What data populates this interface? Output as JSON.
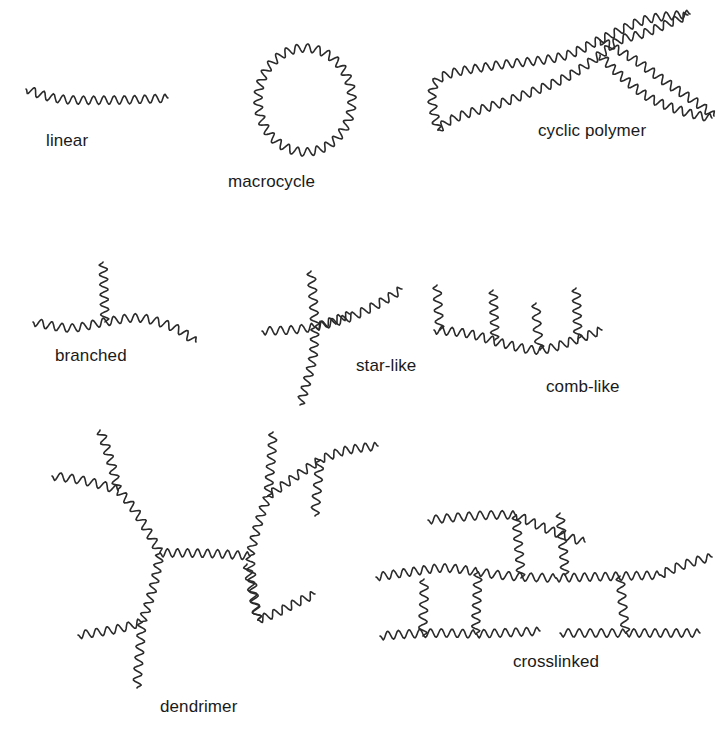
{
  "figure": {
    "width": 723,
    "height": 739,
    "background_color": "#ffffff",
    "stroke_color": "#2b2b2b",
    "stroke_width": 1.6,
    "label_color": "#1a1a1a",
    "label_font_size": 17,
    "wave": {
      "period": 10.5,
      "amplitude": 4.2
    }
  },
  "labels": [
    {
      "id": "linear",
      "text": "linear",
      "x": 46,
      "y": 131
    },
    {
      "id": "macrocycle",
      "text": "macrocycle",
      "x": 228,
      "y": 172
    },
    {
      "id": "cyclic",
      "text": "cyclic polymer",
      "x": 538,
      "y": 121
    },
    {
      "id": "branched",
      "text": "branched",
      "x": 55,
      "y": 346
    },
    {
      "id": "star",
      "text": "star-like",
      "x": 356,
      "y": 356
    },
    {
      "id": "comb",
      "text": "comb-like",
      "x": 546,
      "y": 377
    },
    {
      "id": "dendrimer",
      "text": "dendrimer",
      "x": 160,
      "y": 697
    },
    {
      "id": "crosslinked",
      "text": "crosslinked",
      "x": 513,
      "y": 652
    }
  ],
  "structures": [
    {
      "id": "linear",
      "name": "linear",
      "chains": [
        {
          "points": [
            [
              26,
              89
            ],
            [
              60,
              99
            ],
            [
              120,
              100
            ],
            [
              168,
              98
            ]
          ]
        }
      ]
    },
    {
      "id": "macrocycle",
      "name": "macrocycle",
      "rings": [
        {
          "cx": 305,
          "cy": 100,
          "rx": 47,
          "ry": 52
        }
      ],
      "chains": []
    },
    {
      "id": "cyclic-polymer",
      "name": "cyclic polymer",
      "chains": [
        {
          "points": [
            [
              438,
              130
            ],
            [
              432,
              95
            ],
            [
              444,
              76
            ],
            [
              492,
              66
            ],
            [
              560,
              57
            ],
            [
              600,
              40
            ],
            [
              645,
              20
            ],
            [
              690,
              14
            ]
          ]
        },
        {
          "points": [
            [
              438,
              130
            ],
            [
              455,
              118
            ],
            [
              510,
              100
            ],
            [
              565,
              78
            ],
            [
              600,
              55
            ],
            [
              620,
              40
            ],
            [
              645,
              33
            ],
            [
              688,
              15
            ]
          ]
        },
        {
          "points": [
            [
              600,
              40
            ],
            [
              635,
              60
            ],
            [
              670,
              85
            ],
            [
              700,
              105
            ],
            [
              714,
              116
            ]
          ]
        },
        {
          "points": [
            [
              600,
              55
            ],
            [
              620,
              75
            ],
            [
              650,
              98
            ],
            [
              685,
              112
            ],
            [
              712,
              118
            ]
          ]
        }
      ]
    },
    {
      "id": "branched",
      "name": "branched",
      "chains": [
        {
          "points": [
            [
              33,
              322
            ],
            [
              70,
              328
            ],
            [
              105,
              322
            ],
            [
              140,
              318
            ],
            [
              175,
              328
            ],
            [
              196,
              342
            ]
          ]
        },
        {
          "points": [
            [
              105,
              322
            ],
            [
              104,
              290
            ],
            [
              103,
              262
            ]
          ]
        }
      ]
    },
    {
      "id": "star-like",
      "name": "star-like",
      "chains": [
        {
          "points": [
            [
              315,
              327
            ],
            [
              290,
              330
            ],
            [
              262,
              331
            ]
          ]
        },
        {
          "points": [
            [
              315,
              327
            ],
            [
              313,
              296
            ],
            [
              311,
              271
            ]
          ]
        },
        {
          "points": [
            [
              315,
              327
            ],
            [
              348,
              318
            ],
            [
              378,
              304
            ],
            [
              402,
              289
            ]
          ]
        },
        {
          "points": [
            [
              315,
              327
            ],
            [
              313,
              357
            ],
            [
              306,
              385
            ],
            [
              300,
              405
            ]
          ]
        },
        {
          "points": [
            [
              315,
              327
            ],
            [
              330,
              322
            ],
            [
              350,
              314
            ]
          ]
        }
      ]
    },
    {
      "id": "comb-like",
      "name": "comb-like",
      "chains": [
        {
          "points": [
            [
              434,
              330
            ],
            [
              470,
              334
            ],
            [
              505,
              344
            ],
            [
              540,
              350
            ],
            [
              575,
              340
            ],
            [
              602,
              330
            ]
          ]
        },
        {
          "points": [
            [
              440,
              330
            ],
            [
              438,
              305
            ],
            [
              437,
              285
            ]
          ]
        },
        {
          "points": [
            [
              495,
              340
            ],
            [
              494,
              312
            ],
            [
              493,
              290
            ]
          ]
        },
        {
          "points": [
            [
              540,
              350
            ],
            [
              537,
              325
            ],
            [
              536,
              303
            ]
          ]
        },
        {
          "points": [
            [
              578,
              339
            ],
            [
              577,
              310
            ],
            [
              576,
              288
            ]
          ]
        }
      ]
    },
    {
      "id": "dendrimer",
      "name": "dendrimer",
      "chains": [
        {
          "points": [
            [
              160,
              553
            ],
            [
              190,
              553
            ],
            [
              222,
              554
            ],
            [
              250,
              556
            ]
          ]
        },
        {
          "points": [
            [
              160,
              553
            ],
            [
              146,
              528
            ],
            [
              131,
              505
            ],
            [
              118,
              490
            ]
          ]
        },
        {
          "points": [
            [
              160,
              553
            ],
            [
              155,
              580
            ],
            [
              148,
              605
            ],
            [
              142,
              622
            ]
          ]
        },
        {
          "points": [
            [
              250,
              556
            ],
            [
              255,
              535
            ],
            [
              262,
              512
            ],
            [
              268,
              496
            ]
          ]
        },
        {
          "points": [
            [
              250,
              556
            ],
            [
              252,
              580
            ],
            [
              255,
              602
            ],
            [
              258,
              620
            ]
          ]
        },
        {
          "points": [
            [
              118,
              490
            ],
            [
              98,
              484
            ],
            [
              75,
              479
            ],
            [
              52,
              476
            ]
          ]
        },
        {
          "points": [
            [
              118,
              490
            ],
            [
              112,
              466
            ],
            [
              105,
              444
            ],
            [
              100,
              430
            ]
          ]
        },
        {
          "points": [
            [
              142,
              622
            ],
            [
              122,
              628
            ],
            [
              100,
              632
            ],
            [
              78,
              635
            ]
          ]
        },
        {
          "points": [
            [
              142,
              622
            ],
            [
              140,
              648
            ],
            [
              138,
              670
            ],
            [
              137,
              688
            ]
          ]
        },
        {
          "points": [
            [
              268,
              496
            ],
            [
              285,
              484
            ],
            [
              305,
              470
            ],
            [
              320,
              460
            ]
          ]
        },
        {
          "points": [
            [
              268,
              496
            ],
            [
              270,
              472
            ],
            [
              272,
              450
            ],
            [
              273,
              432
            ]
          ]
        },
        {
          "points": [
            [
              258,
              620
            ],
            [
              278,
              612
            ],
            [
              298,
              602
            ],
            [
              315,
              594
            ]
          ]
        },
        {
          "points": [
            [
              258,
              620
            ],
            [
              254,
              600
            ],
            [
              250,
              580
            ],
            [
              247,
              564
            ]
          ]
        },
        {
          "points": [
            [
              320,
              460
            ],
            [
              340,
              452
            ],
            [
              360,
              448
            ],
            [
              378,
              446
            ]
          ]
        },
        {
          "points": [
            [
              320,
              460
            ],
            [
              318,
              482
            ],
            [
              316,
              502
            ],
            [
              315,
              516
            ]
          ]
        }
      ]
    },
    {
      "id": "crosslinked",
      "name": "crosslinked",
      "chains": [
        {
          "points": [
            [
              428,
              520
            ],
            [
              460,
              517
            ],
            [
              490,
              515
            ],
            [
              516,
              515
            ]
          ]
        },
        {
          "points": [
            [
              516,
              515
            ],
            [
              540,
              526
            ],
            [
              565,
              536
            ],
            [
              585,
              542
            ]
          ]
        },
        {
          "points": [
            [
              516,
              515
            ],
            [
              518,
              540
            ],
            [
              520,
              562
            ],
            [
              521,
              578
            ]
          ]
        },
        {
          "points": [
            [
              560,
              513
            ],
            [
              562,
              537
            ],
            [
              564,
              558
            ],
            [
              565,
              575
            ]
          ]
        },
        {
          "points": [
            [
              376,
              577
            ],
            [
              410,
              572
            ],
            [
              445,
              568
            ],
            [
              478,
              572
            ]
          ]
        },
        {
          "points": [
            [
              478,
              572
            ],
            [
              500,
              575
            ],
            [
              525,
              577
            ],
            [
              556,
              578
            ]
          ]
        },
        {
          "points": [
            [
              556,
              578
            ],
            [
              590,
              577
            ],
            [
              625,
              576
            ],
            [
              660,
              575
            ]
          ]
        },
        {
          "points": [
            [
              660,
              575
            ],
            [
              678,
              567
            ],
            [
              696,
              561
            ],
            [
              712,
              557
            ]
          ]
        },
        {
          "points": [
            [
              478,
              572
            ],
            [
              477,
              598
            ],
            [
              476,
              618
            ],
            [
              476,
              634
            ]
          ]
        },
        {
          "points": [
            [
              424,
              579
            ],
            [
              424,
              600
            ],
            [
              423,
              620
            ],
            [
              423,
              636
            ]
          ]
        },
        {
          "points": [
            [
              620,
              576
            ],
            [
              622,
              598
            ],
            [
              624,
              618
            ],
            [
              626,
              633
            ]
          ]
        },
        {
          "points": [
            [
              380,
              636
            ],
            [
              408,
              634
            ],
            [
              440,
              633
            ],
            [
              476,
              634
            ]
          ]
        },
        {
          "points": [
            [
              476,
              634
            ],
            [
              500,
              633
            ],
            [
              520,
              632
            ],
            [
              540,
              631
            ]
          ]
        },
        {
          "points": [
            [
              560,
              633
            ],
            [
              590,
              633
            ],
            [
              612,
              633
            ],
            [
              626,
              633
            ]
          ]
        },
        {
          "points": [
            [
              626,
              633
            ],
            [
              650,
              633
            ],
            [
              675,
              633
            ],
            [
              700,
              633
            ]
          ]
        }
      ]
    }
  ]
}
